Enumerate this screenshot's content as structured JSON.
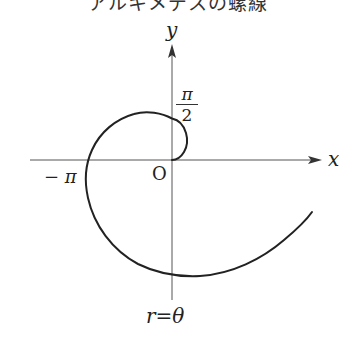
{
  "title": "アルキメデスの螺線",
  "axes": {
    "x_label": "x",
    "y_label": "y",
    "origin_label": "O"
  },
  "labels": {
    "pi_half_numerator": "π",
    "pi_half_denominator": "2",
    "minus_pi": "− π",
    "equation_r": "r",
    "equation_eq": "=",
    "equation_theta": "θ"
  },
  "curve": {
    "equation": "r = θ",
    "theta_range": [
      0,
      5.92
    ],
    "color": "#222222"
  }
}
